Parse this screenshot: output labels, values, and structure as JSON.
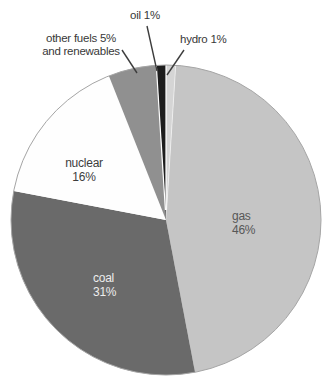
{
  "chart_data": {
    "type": "pie",
    "title": "",
    "unit": "%",
    "direction": "clockwise",
    "start_angle_deg": 0,
    "legend": "none",
    "labels_on_chart": true,
    "slices": [
      {
        "label": "hydro",
        "value": 1,
        "color": "#d5d5d5"
      },
      {
        "label": "gas",
        "value": 46,
        "color": "#c5c5c5"
      },
      {
        "label": "coal",
        "value": 31,
        "color": "#6a6a6a"
      },
      {
        "label": "nuclear",
        "value": 16,
        "color": "#fefefe"
      },
      {
        "label": "other fuels and renewables",
        "value": 5,
        "color": "#909090"
      },
      {
        "label": "oil",
        "value": 1,
        "color": "#1d1d1d"
      }
    ]
  },
  "labels": {
    "oil": "oil 1%",
    "hydro": "hydro 1%",
    "other_line1": "other fuels 5%",
    "other_line2": "and renewables",
    "nuclear_line1": "nuclear",
    "nuclear_line2": "16%",
    "gas_line1": "gas",
    "gas_line2": "46%",
    "coal_line1": "coal",
    "coal_line2": "31%"
  },
  "colors": {
    "background": "#ffffff",
    "pie_outline": "#a5a5a5",
    "leader_line": "#3d3d3d",
    "separator": "#ffffff",
    "label_text": "#383838",
    "gas_label_text": "#575757",
    "coal_label_text": "#ededed",
    "nuclear_label_text": "#3d3d3d"
  }
}
